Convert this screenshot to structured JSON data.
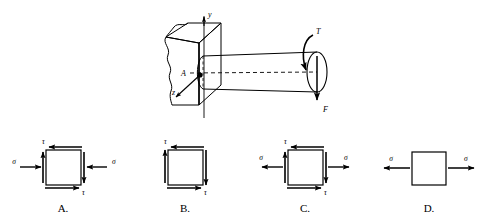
{
  "figure": {
    "colors": {
      "background": "#ffffff",
      "ink": "#000000"
    },
    "main_diagram": {
      "name": "cantilever-shaft-diagram",
      "wall": {
        "label": "fixed-wall-block",
        "description": "rectangular block with torn wavy left edge representing a fixed support"
      },
      "shaft": {
        "label": "circular-shaft",
        "description": "horizontal cylindrical shaft cantilevered from the wall with dashed centerline"
      },
      "axes": [
        {
          "name": "y-axis",
          "label": "y",
          "direction": "up"
        },
        {
          "name": "z-axis",
          "label": "z",
          "direction": "down-left"
        }
      ],
      "point_label": "A",
      "loads": [
        {
          "name": "torque",
          "label": "T",
          "type": "curved-moment-arrow"
        },
        {
          "name": "force",
          "label": "F",
          "type": "straight-down-arrow"
        }
      ]
    },
    "options": [
      {
        "id": "A",
        "label": "A.",
        "name": "stress-element-option-a",
        "state": "compression plus shear",
        "normal_stress_symbol": "σ",
        "shear_stress_symbol": "τ",
        "has_normal": true,
        "has_shear": true,
        "normal_sense": "compressive",
        "left_sigma": "σ",
        "right_sigma": "σ",
        "top_tau": "τ",
        "bottom_tau": "τ"
      },
      {
        "id": "B",
        "label": "B.",
        "name": "stress-element-option-b",
        "state": "pure shear",
        "normal_stress_symbol": "",
        "shear_stress_symbol": "τ",
        "has_normal": false,
        "has_shear": true,
        "normal_sense": "none",
        "left_sigma": "",
        "right_sigma": "",
        "top_tau": "τ",
        "bottom_tau": "τ"
      },
      {
        "id": "C",
        "label": "C.",
        "name": "stress-element-option-c",
        "state": "tension plus shear",
        "normal_stress_symbol": "σ",
        "shear_stress_symbol": "τ",
        "has_normal": true,
        "has_shear": true,
        "normal_sense": "tensile",
        "left_sigma": "σ",
        "right_sigma": "σ",
        "top_tau": "τ",
        "bottom_tau": "τ"
      },
      {
        "id": "D",
        "label": "D.",
        "name": "stress-element-option-d",
        "state": "uniaxial tension only",
        "normal_stress_symbol": "σ",
        "shear_stress_symbol": "",
        "has_normal": true,
        "has_shear": false,
        "normal_sense": "tensile",
        "left_sigma": "σ",
        "right_sigma": "σ",
        "top_tau": "",
        "bottom_tau": ""
      }
    ]
  }
}
